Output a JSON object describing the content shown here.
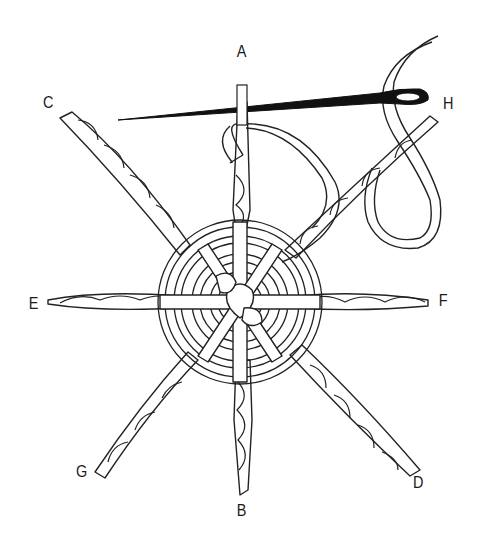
{
  "figure": {
    "labels": {
      "A": "A",
      "B": "B",
      "C": "C",
      "D": "D",
      "E": "E",
      "F": "F",
      "G": "G",
      "H": "H"
    },
    "colors": {
      "line": "#222222",
      "needle": "#111111",
      "background": "#ffffff"
    }
  }
}
